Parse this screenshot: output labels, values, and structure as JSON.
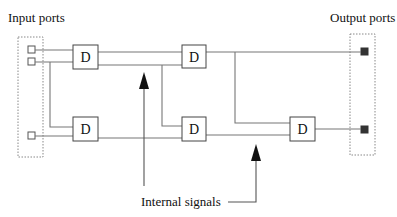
{
  "labels": {
    "input_ports": "Input ports",
    "output_ports": "Output ports",
    "internal_signals": "Internal signals"
  },
  "blocks": [
    {
      "id": "d1",
      "label": "D"
    },
    {
      "id": "d2",
      "label": "D"
    },
    {
      "id": "d3",
      "label": "D"
    },
    {
      "id": "d4",
      "label": "D"
    },
    {
      "id": "d5",
      "label": "D"
    }
  ],
  "ports": {
    "inputs": 3,
    "outputs": 2
  },
  "colors": {
    "wire": "#777777",
    "box_stroke": "#444444",
    "output_port_fill": "#333333",
    "arrow": "#111111"
  }
}
